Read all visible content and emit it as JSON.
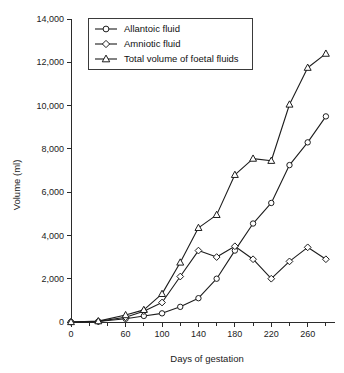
{
  "chart_data": {
    "type": "line",
    "title": "",
    "xlabel": "Days of gestation",
    "ylabel": "Volume (ml)",
    "xlim": [
      0,
      290
    ],
    "ylim": [
      0,
      14000
    ],
    "grid": false,
    "legend_position": "top-left-inside",
    "x_ticks_major": [
      0,
      60,
      100,
      140,
      180,
      220,
      260
    ],
    "x_tick_labels": [
      "0",
      "60",
      "100",
      "140",
      "180",
      "220",
      "260"
    ],
    "x_ticks_minor": [
      20,
      40,
      80,
      120,
      160,
      200,
      240,
      280
    ],
    "y_ticks": [
      0,
      2000,
      4000,
      6000,
      8000,
      10000,
      12000,
      14000
    ],
    "y_tick_labels": [
      "0",
      "2,000",
      "4,000",
      "6,000",
      "8,000",
      "10,000",
      "12,000",
      "14,000"
    ],
    "series": [
      {
        "name": "Allantoic fluid",
        "marker": "circle",
        "x": [
          0,
          30,
          60,
          80,
          100,
          120,
          140,
          160,
          180,
          200,
          220,
          240,
          260,
          280
        ],
        "values": [
          0,
          20,
          150,
          280,
          400,
          700,
          1100,
          2000,
          3300,
          4550,
          5500,
          7250,
          8300,
          9500
        ]
      },
      {
        "name": "Amniotic fluid",
        "marker": "diamond",
        "x": [
          0,
          30,
          60,
          80,
          100,
          120,
          140,
          160,
          180,
          200,
          220,
          240,
          260,
          280
        ],
        "values": [
          0,
          30,
          220,
          500,
          900,
          2100,
          3300,
          3000,
          3500,
          2900,
          2000,
          2800,
          3450,
          2900
        ]
      },
      {
        "name": "Total volume of foetal fluids",
        "marker": "triangle",
        "x": [
          0,
          30,
          60,
          80,
          100,
          120,
          140,
          160,
          180,
          200,
          220,
          240,
          260,
          280
        ],
        "values": [
          0,
          40,
          320,
          560,
          1300,
          2750,
          4350,
          4950,
          6800,
          7550,
          7450,
          10050,
          11750,
          12400
        ]
      }
    ]
  },
  "legend": {
    "entries": [
      {
        "label": "Allantoic fluid",
        "marker": "circle-marker-icon"
      },
      {
        "label": "Amniotic fluid",
        "marker": "diamond-marker-icon"
      },
      {
        "label": "Total volume of foetal fluids",
        "marker": "triangle-marker-icon"
      }
    ]
  }
}
